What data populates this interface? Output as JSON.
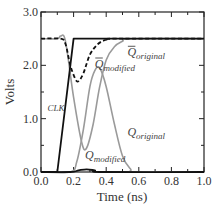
{
  "chart_data": {
    "type": "line",
    "title": "",
    "xlabel": "Time (ns)",
    "ylabel": "Volts",
    "xlim": [
      0.0,
      1.0
    ],
    "ylim": [
      0.0,
      3.0
    ],
    "x_ticks": [
      "0.0",
      "0.2",
      "0.4",
      "0.6",
      "0.8",
      "1.0"
    ],
    "y_ticks": [
      "0.0",
      "1.0",
      "2.0",
      "3.0"
    ],
    "grid": false,
    "legend": "none (inline annotations)",
    "series": [
      {
        "name": "CLK",
        "style": "solid black",
        "x": [
          0.0,
          0.1,
          0.2,
          1.0
        ],
        "y": [
          0.0,
          0.0,
          2.5,
          2.5
        ]
      },
      {
        "name": "Q̄ modified",
        "style": "dashed black",
        "x": [
          0.0,
          0.12,
          0.15,
          0.18,
          0.21,
          0.23,
          0.26,
          0.3,
          0.35,
          0.4,
          0.45,
          1.0
        ],
        "y": [
          2.5,
          2.5,
          2.4,
          2.0,
          1.75,
          1.7,
          1.85,
          2.2,
          2.4,
          2.48,
          2.5,
          2.5
        ]
      },
      {
        "name": "Q̄ original",
        "style": "solid gray",
        "x": [
          0.0,
          0.1,
          0.12,
          0.15,
          0.2,
          0.25,
          0.28,
          0.32,
          0.36,
          0.4,
          0.45,
          0.5,
          0.55,
          1.0
        ],
        "y": [
          2.5,
          2.5,
          2.55,
          2.45,
          1.4,
          0.55,
          0.45,
          0.9,
          1.6,
          2.1,
          2.35,
          2.45,
          2.5,
          2.5
        ]
      },
      {
        "name": "Q original",
        "style": "solid gray",
        "x": [
          0.0,
          0.18,
          0.22,
          0.26,
          0.3,
          0.33,
          0.36,
          0.4,
          0.45,
          0.5,
          0.55,
          0.58,
          1.0
        ],
        "y": [
          0.0,
          0.0,
          0.2,
          0.8,
          1.6,
          1.9,
          1.95,
          1.6,
          0.9,
          0.3,
          0.05,
          0.0,
          0.0
        ]
      },
      {
        "name": "Q modified",
        "style": "solid black",
        "x": [
          0.0,
          0.18,
          0.23,
          0.28,
          0.33,
          0.38,
          1.0
        ],
        "y": [
          0.0,
          0.0,
          0.03,
          0.05,
          0.03,
          0.0,
          0.0
        ]
      }
    ],
    "annotations": [
      {
        "text": "CLK",
        "x": 0.05,
        "y": 1.15
      },
      {
        "text": "Q̄ modified",
        "x": 0.33,
        "y": 1.95
      },
      {
        "text": "Q̄ original",
        "x": 0.53,
        "y": 2.15
      },
      {
        "text": "Q original",
        "x": 0.53,
        "y": 0.7
      },
      {
        "text": "Q modified",
        "x": 0.27,
        "y": 0.25
      }
    ]
  },
  "labels": {
    "xlabel": "Time (ns)",
    "ylabel": "Volts",
    "clk": "CLK",
    "q_letter": "Q",
    "sub_modified": "modified",
    "sub_original": "original"
  }
}
